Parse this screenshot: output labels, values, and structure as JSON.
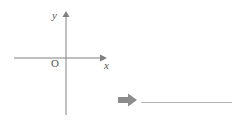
{
  "figure": {
    "type": "cartesian-axes",
    "axis_labels": {
      "y": "y",
      "x": "x",
      "origin": "O"
    },
    "colors": {
      "axis": "#808080",
      "text": "#555555",
      "arrow": "#8c8c8c",
      "rule": "#b4b4b4",
      "background": "#ffffff"
    },
    "geometry": {
      "origin_x": 66,
      "origin_y": 58,
      "x_axis_start": 14,
      "x_axis_end": 103,
      "y_axis_top": 13,
      "y_axis_bottom": 115
    }
  },
  "answer": {
    "arrow_icon": "right-block-arrow",
    "blank_text": "",
    "line_width": 91
  }
}
